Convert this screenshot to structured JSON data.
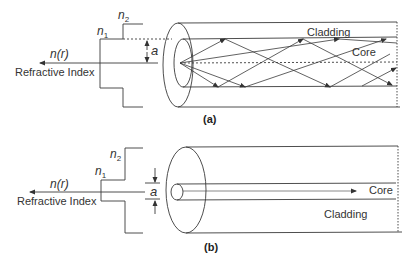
{
  "panel_a": {
    "caption": "(a)",
    "n2": "n",
    "n2_sub": "2",
    "n1": "n",
    "n1_sub": "1",
    "radius_label": "a",
    "axis_label": "n(r)",
    "axis_title": "Refractive Index",
    "cladding_label": "Cladding",
    "core_label": "Core",
    "description": "Step-index multimode fiber with zig-zag rays reflecting at core/cladding boundary"
  },
  "panel_b": {
    "caption": "(b)",
    "n2": "n",
    "n2_sub": "2",
    "n1": "n",
    "n1_sub": "1",
    "radius_label": "a",
    "axis_label": "n(r)",
    "axis_title": "Refractive Index",
    "core_label": "Core",
    "cladding_label": "Cladding",
    "description": "Single-mode fiber with narrow core and straight ray"
  },
  "colors": {
    "line": "#3a3a3a",
    "text": "#333333",
    "background": "#ffffff"
  }
}
